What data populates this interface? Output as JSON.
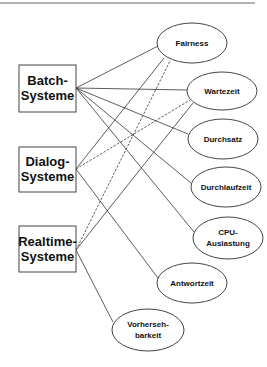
{
  "diagram": {
    "title": "",
    "systems": [
      {
        "id": "batch",
        "line1": "Batch-",
        "line2": "Systeme"
      },
      {
        "id": "dialog",
        "line1": "Dialog-",
        "line2": "Systeme"
      },
      {
        "id": "realtime",
        "line1": "Realtime-",
        "line2": "Systeme"
      }
    ],
    "criteria": [
      {
        "id": "fairness",
        "line1": "Fairness",
        "line2": ""
      },
      {
        "id": "wartezeit",
        "line1": "Wartezeit",
        "line2": ""
      },
      {
        "id": "durchsatz",
        "line1": "Durchsatz",
        "line2": ""
      },
      {
        "id": "durchlaufzeit",
        "line1": "Durchlaufzeit",
        "line2": ""
      },
      {
        "id": "cpu",
        "line1": "CPU-",
        "line2": "Auslastung"
      },
      {
        "id": "antwortzeit",
        "line1": "Antwortzeit",
        "line2": ""
      },
      {
        "id": "vorhersehbarkeit",
        "line1": "Vorherseh-",
        "line2": "barkeit"
      }
    ],
    "edges": [
      {
        "from": "batch",
        "to": "fairness",
        "style": "solid"
      },
      {
        "from": "batch",
        "to": "wartezeit",
        "style": "solid"
      },
      {
        "from": "batch",
        "to": "durchsatz",
        "style": "solid"
      },
      {
        "from": "batch",
        "to": "durchlaufzeit",
        "style": "solid"
      },
      {
        "from": "batch",
        "to": "cpu",
        "style": "solid"
      },
      {
        "from": "dialog",
        "to": "fairness",
        "style": "solid"
      },
      {
        "from": "dialog",
        "to": "wartezeit",
        "style": "dashed"
      },
      {
        "from": "dialog",
        "to": "antwortzeit",
        "style": "solid"
      },
      {
        "from": "realtime",
        "to": "fairness",
        "style": "dashed"
      },
      {
        "from": "realtime",
        "to": "wartezeit",
        "style": "solid"
      },
      {
        "from": "realtime",
        "to": "vorhersehbarkeit",
        "style": "solid"
      }
    ]
  }
}
